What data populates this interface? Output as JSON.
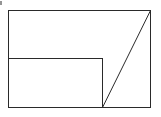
{
  "diagram": {
    "shapes": [
      "outer-rectangle",
      "inner-rectangle",
      "diagonal-line"
    ],
    "line_color": "#2a2a2a",
    "background_color": "#ffffff",
    "labels": []
  }
}
